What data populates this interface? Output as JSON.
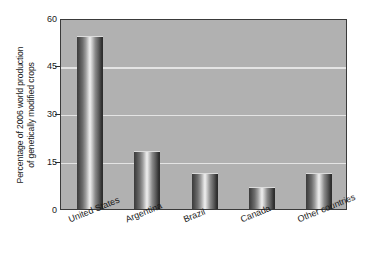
{
  "chart_data": {
    "type": "bar",
    "title": "",
    "subtitle": "",
    "xlabel": "",
    "ylabel_lines": [
      "Percentage of 2006 world production",
      "of genetically modified crops"
    ],
    "ylabel": "Percentage of 2006 world production of genetically modified crops",
    "categories": [
      "United States",
      "Argentina",
      "Brazil",
      "Canada",
      "Other countries"
    ],
    "values": [
      54,
      18,
      11,
      6.5,
      11
    ],
    "ylim": [
      0,
      60
    ],
    "yticks": [
      0,
      15,
      30,
      45,
      60
    ],
    "ytick_labels": [
      "0",
      "15",
      "30",
      "45",
      "60"
    ],
    "grid": true,
    "grid_axis": "y",
    "legend": false,
    "legend_position": "none",
    "bar_style": "cylinder-gradient",
    "colors": {
      "plot_background": "#b1b1b1",
      "gridline": "#e4e4e4",
      "axis": "#3a3a3a",
      "bar_dark": "#2f2f2f",
      "bar_light": "#efefef",
      "text": "#1a1a1a",
      "page_background": "#ffffff"
    }
  }
}
